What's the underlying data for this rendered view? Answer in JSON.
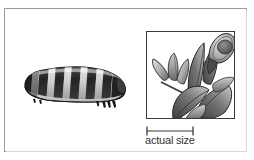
{
  "figure": {
    "type": "natural-history-illustration",
    "style": "grayscale-engraving",
    "background_color": "#ffffff",
    "frame": {
      "name": "outer-frame",
      "border_color": "#9b9b9b",
      "shadow_color": "#d8d8d8"
    },
    "subjects": {
      "caterpillar": {
        "name": "caterpillar-illustration",
        "description": "segmented caterpillar larva, banded dark and light, head to the right with prolegs beneath",
        "body_dark": "#2b2b2b",
        "body_mid": "#6e6e6e",
        "body_light": "#d8d8d8",
        "underside": "#efefef",
        "outline": "#1a1a1a"
      },
      "plant": {
        "name": "plant-illustration",
        "description": "plant stem with lanceolate leaves and a closed flower bud at upper right",
        "leaf_dark": "#4a4a4a",
        "leaf_mid": "#8a8a8a",
        "leaf_light": "#cfcfcf",
        "bud_fill": "#bdbdbd",
        "bud_center": "#6a6a6a",
        "outline": "#2a2a2a",
        "box_border": "#3a3a3a"
      }
    },
    "scale": {
      "name": "scale-bar-group",
      "label": "actual size",
      "bar_color": "#3a3a3a",
      "bar_length_px": 48,
      "tick_count": 2
    }
  }
}
